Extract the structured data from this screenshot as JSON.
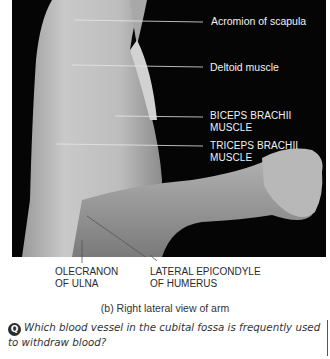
{
  "figure": {
    "labels_right": [
      {
        "text": "Acromion of scapula"
      },
      {
        "text": "Deltoid muscle"
      },
      {
        "text_line1": "BICEPS BRACHII",
        "text_line2": "MUSCLE"
      },
      {
        "text_line1": "TRICEPS BRACHII",
        "text_line2": "MUSCLE"
      }
    ],
    "labels_below": [
      {
        "text_line1": "OLECRANON",
        "text_line2": "OF ULNA"
      },
      {
        "text_line1": "LATERAL EPICONDYLE",
        "text_line2": "OF HUMERUS"
      }
    ],
    "caption": "(b) Right lateral view of arm"
  },
  "question": {
    "badge": "Q",
    "text": "Which blood vessel in the cubital fossa is frequently used to withdraw blood?"
  }
}
